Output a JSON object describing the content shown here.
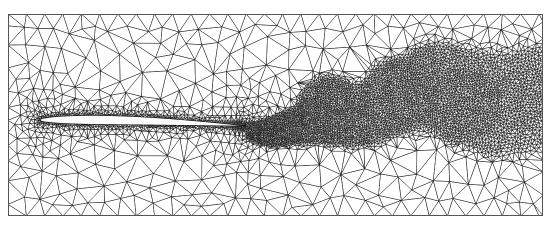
{
  "figure": {
    "type": "mesh-plot",
    "width": 552,
    "height": 234,
    "background_color": "#ffffff",
    "line_color": "#1a1a1a",
    "body_fill_color": "#ffffff",
    "line_width": 0.45
  },
  "domain": {
    "name": "computational-domain",
    "x_min": 8,
    "y_min": 14,
    "x_max": 543,
    "y_max": 216,
    "border_color": "#555555",
    "border_width": 1.0,
    "description": "rectangular outer boundary of the flow domain"
  },
  "body": {
    "name": "airfoil",
    "shape": "symmetric-airfoil",
    "leading_edge": [
      40,
      120
    ],
    "trailing_edge": [
      246,
      126
    ],
    "chord": 206,
    "max_thickness": 18,
    "max_thickness_station": 0.26,
    "angle_of_attack_deg": -1.6,
    "fill": "#ffffff",
    "outline": "#111111"
  },
  "mesh": {
    "name": "triangulation",
    "element_type": "triangle",
    "scheme": "Delaunay",
    "refinement": "solution-adaptive",
    "approx_node_count": 9800,
    "coarse_spacing": 26,
    "fine_spacing": 1.6,
    "boundary_layer_spacing": 1.2
  },
  "refinement_zones": [
    {
      "name": "boundary-layer",
      "region": "airfoil-surface",
      "target_spacing": 1.2,
      "thickness": 7
    },
    {
      "name": "leading-edge-cluster",
      "center": [
        40,
        120
      ],
      "radius": 26,
      "target_spacing": 1.8
    },
    {
      "name": "trailing-edge-cluster",
      "center": [
        246,
        126
      ],
      "radius": 22,
      "target_spacing": 1.5
    },
    {
      "name": "near-wake",
      "center": [
        300,
        112
      ],
      "radius_x": 70,
      "radius_y": 26,
      "target_spacing": 2.0
    },
    {
      "name": "vortex-blob-1",
      "center": [
        330,
        108
      ],
      "radius": 34,
      "target_spacing": 2.2
    },
    {
      "name": "vortex-blob-2",
      "center": [
        400,
        96
      ],
      "radius": 40,
      "target_spacing": 2.4
    },
    {
      "name": "vortex-blob-3",
      "center": [
        462,
        104
      ],
      "radius": 42,
      "target_spacing": 2.6
    },
    {
      "name": "vortex-blob-4",
      "center": [
        520,
        98
      ],
      "radius": 36,
      "target_spacing": 3.0
    },
    {
      "name": "far-field",
      "region": "outer",
      "target_spacing": 26
    }
  ],
  "chart_data": {
    "type": "mesh",
    "xlabel": "",
    "ylabel": "",
    "xlim": [
      8,
      543
    ],
    "ylim": [
      14,
      216
    ],
    "grid": false,
    "legend": false,
    "annotations": [],
    "series": [
      {
        "name": "mesh-edges",
        "kind": "triangular-edges",
        "color": "#1a1a1a"
      },
      {
        "name": "airfoil-body",
        "kind": "filled-polygon",
        "color": "#ffffff"
      }
    ],
    "density_profile": {
      "description": "element size varies smoothly from ~26 px in the far field to ~1.2 px in the airfoil boundary layer and ~2-3 px in the shed-vortex wake",
      "x_samples": [
        8,
        40,
        90,
        150,
        200,
        246,
        300,
        360,
        420,
        480,
        543
      ],
      "min_spacing_at_x": [
        22,
        2.0,
        1.4,
        1.6,
        1.5,
        1.5,
        2.0,
        2.2,
        2.4,
        2.6,
        3.0
      ]
    }
  }
}
